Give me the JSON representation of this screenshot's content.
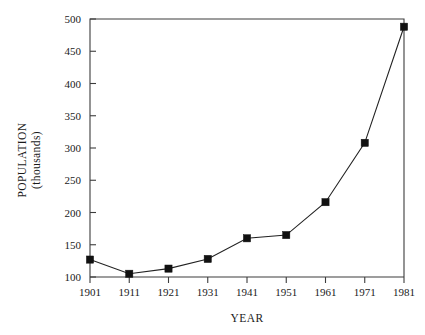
{
  "chart_data": {
    "type": "line",
    "title": "",
    "xlabel": "YEAR",
    "ylabel": "POPULATION (thousands)",
    "ylabel_line1": "POPULATION",
    "ylabel_line2": "(thousands)",
    "categories": [
      "1901",
      "1911",
      "1921",
      "1931",
      "1941",
      "1951",
      "1961",
      "1971",
      "1981"
    ],
    "x": [
      1901,
      1911,
      1921,
      1931,
      1941,
      1951,
      1961,
      1971,
      1981
    ],
    "values": [
      127,
      105,
      113,
      128,
      160,
      165,
      216,
      308,
      488
    ],
    "xlim": [
      1901,
      1981
    ],
    "ylim": [
      100,
      500
    ],
    "yticks": [
      100,
      150,
      200,
      250,
      300,
      350,
      400,
      450,
      500
    ],
    "ytick_labels": [
      "100",
      "150",
      "200",
      "250",
      "300",
      "350",
      "400",
      "450",
      "500"
    ],
    "xticks": [
      1901,
      1911,
      1921,
      1931,
      1941,
      1951,
      1961,
      1971,
      1981
    ],
    "xtick_labels": [
      "1901",
      "1911",
      "1921",
      "1931",
      "1941",
      "1951",
      "1961",
      "1971",
      "1981"
    ],
    "grid": false,
    "legend": null,
    "legend_position": "none",
    "marker": "filled-square",
    "series_color": "#111111",
    "axis_color": "#3c3c3c",
    "background_color": "#ffffff",
    "series": [
      {
        "name": "Population",
        "values": [
          127,
          105,
          113,
          128,
          160,
          165,
          216,
          308,
          488
        ]
      }
    ]
  }
}
